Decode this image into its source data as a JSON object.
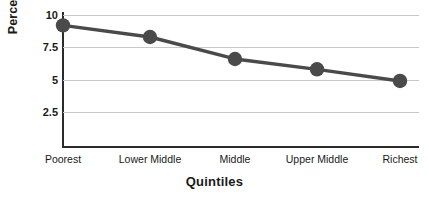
{
  "chart_data": {
    "type": "line",
    "title": "",
    "xlabel": "Quintiles",
    "ylabel": "Percent",
    "categories": [
      "Poorest",
      "Lower Middle",
      "Middle",
      "Upper Middle",
      "Richest"
    ],
    "values": [
      9.2,
      8.3,
      6.6,
      5.8,
      4.9
    ],
    "series": [
      {
        "name": "Percent",
        "values": [
          9.2,
          8.3,
          6.6,
          5.8,
          4.9
        ]
      }
    ],
    "yticks": [
      10,
      7.5,
      5,
      2.5
    ],
    "ytick_labels": [
      "10",
      "7.5",
      "5",
      "2.5"
    ],
    "ylim": [
      0,
      10.9
    ],
    "grid": "horizontal",
    "legend": "none",
    "line_color": "#4a4a4a",
    "marker_color": "#4a4a4a",
    "marker": "circle",
    "grid_color": "#c8c8c8",
    "axis_color": "#2b2b2b",
    "background": "#ffffff"
  }
}
